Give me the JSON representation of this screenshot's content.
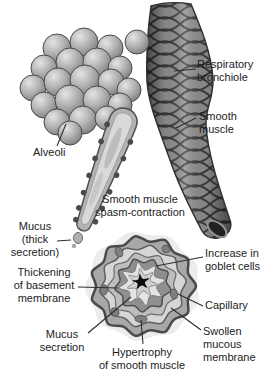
{
  "figure": {
    "background_color": "#ffffff",
    "text_color": "#1c1c1c",
    "labels": {
      "respiratory_bronchiole": "Respiratory\nbronchiole",
      "smooth_muscle": "Smooth\nmuscle",
      "alveoli": "Alveoli",
      "spasm_contraction": "Smooth muscle\nspasm-contraction",
      "mucus_thick": "Mucus\n(thick\nsecretion)",
      "thickening_basement": "Thickening\nof basement\nmembrane",
      "mucus_secretion": "Mucus\nsecretion",
      "hypertrophy": "Hypertrophy\nof smooth muscle",
      "goblet_cells": "Increase in\ngoblet cells",
      "capillary": "Capillary",
      "swollen_membrane": "Swollen\nmucous\nmembrane"
    }
  }
}
